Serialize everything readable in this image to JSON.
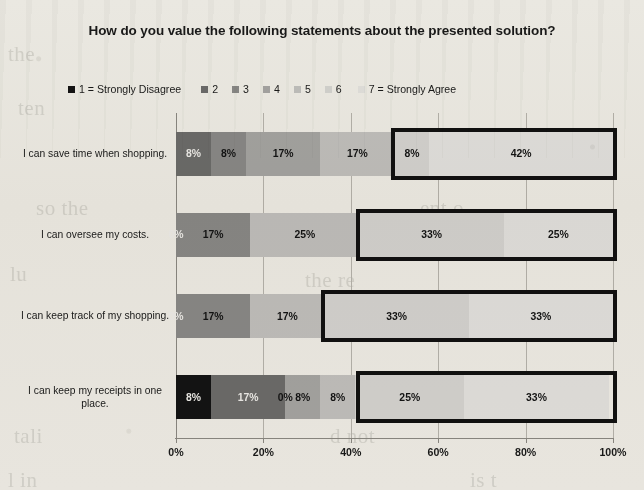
{
  "chart_data": {
    "type": "bar",
    "subtype": "stacked-100-horizontal",
    "title": "How do you value the following statements about the presented solution?",
    "xlabel": "",
    "ylabel": "",
    "xlim": [
      0,
      100
    ],
    "xticks": [
      "0%",
      "20%",
      "40%",
      "60%",
      "80%",
      "100%"
    ],
    "xtick_values": [
      0,
      20,
      40,
      60,
      80,
      100
    ],
    "grid": true,
    "legend_position": "top",
    "categories": [
      "I can save time when shopping.",
      "I can oversee my costs.",
      "I can keep track of my shopping.",
      "I can keep my receipts in one place."
    ],
    "series": [
      {
        "name": "1 = Strongly Disagree",
        "color": "#141414",
        "values": [
          0,
          0,
          0,
          8
        ]
      },
      {
        "name": "2",
        "color": "#6e6e6e",
        "values": [
          8,
          0,
          0,
          17
        ]
      },
      {
        "name": "3",
        "color": "#8c8c8c",
        "values": [
          8,
          17,
          17,
          0
        ]
      },
      {
        "name": "4",
        "color": "#a8a8a8",
        "values": [
          17,
          0,
          0,
          8
        ]
      },
      {
        "name": "5",
        "color": "#c4c4c4",
        "values": [
          17,
          25,
          17,
          8
        ]
      },
      {
        "name": "6",
        "color": "#d8d8d8",
        "values": [
          8,
          33,
          33,
          25
        ]
      },
      {
        "name": "7 = Strongly Agree",
        "color": "#e6e6e6",
        "values": [
          42,
          25,
          33,
          33
        ]
      }
    ],
    "bar_labels": [
      [
        "8%",
        "8%",
        "17%",
        "17%",
        "8%",
        "42%"
      ],
      [
        "0%",
        "17%",
        "25%",
        "33%",
        "25%"
      ],
      [
        "0%",
        "17%",
        "17%",
        "33%",
        "33%"
      ],
      [
        "8%",
        "17%",
        "0%",
        "8%",
        "8%",
        "25%",
        "33%"
      ]
    ],
    "annotations": [
      {
        "name": "agree-highlight",
        "description": "Thick black rectangle outlining combined 6 and 7 segments",
        "color": "#111111"
      }
    ],
    "rows": [
      {
        "label": "I can save time when shopping.",
        "segments": [
          {
            "series": "1 = Strongly Disagree",
            "value": 0,
            "label": "",
            "color": "#141414"
          },
          {
            "series": "2",
            "value": 8,
            "label": "8%",
            "color": "#6e6e6e"
          },
          {
            "series": "3",
            "value": 8,
            "label": "8%",
            "color": "#8c8c8c"
          },
          {
            "series": "4",
            "value": 17,
            "label": "17%",
            "color": "#a8a8a8"
          },
          {
            "series": "5",
            "value": 17,
            "label": "17%",
            "color": "#c4c4c4"
          },
          {
            "series": "6",
            "value": 8,
            "label": "8%",
            "color": "#d8d8d8"
          },
          {
            "series": "7 = Strongly Agree",
            "value": 42,
            "label": "42%",
            "color": "#e6e6e6"
          }
        ],
        "highlight_start": 50,
        "highlight_end": 100
      },
      {
        "label": "I can oversee my costs.",
        "segments": [
          {
            "series": "1 = Strongly Disagree",
            "value": 0,
            "label": "0%",
            "color": "#141414"
          },
          {
            "series": "2",
            "value": 0,
            "label": "",
            "color": "#6e6e6e"
          },
          {
            "series": "3",
            "value": 17,
            "label": "17%",
            "color": "#8c8c8c"
          },
          {
            "series": "4",
            "value": 0,
            "label": "",
            "color": "#a8a8a8"
          },
          {
            "series": "5",
            "value": 25,
            "label": "25%",
            "color": "#c4c4c4"
          },
          {
            "series": "6",
            "value": 33,
            "label": "33%",
            "color": "#d8d8d8"
          },
          {
            "series": "7 = Strongly Agree",
            "value": 25,
            "label": "25%",
            "color": "#e6e6e6"
          }
        ],
        "highlight_start": 42,
        "highlight_end": 100
      },
      {
        "label": "I can keep track of my shopping.",
        "segments": [
          {
            "series": "1 = Strongly Disagree",
            "value": 0,
            "label": "0%",
            "color": "#141414"
          },
          {
            "series": "2",
            "value": 0,
            "label": "",
            "color": "#6e6e6e"
          },
          {
            "series": "3",
            "value": 17,
            "label": "17%",
            "color": "#8c8c8c"
          },
          {
            "series": "4",
            "value": 0,
            "label": "",
            "color": "#a8a8a8"
          },
          {
            "series": "5",
            "value": 17,
            "label": "17%",
            "color": "#c4c4c4"
          },
          {
            "series": "6",
            "value": 33,
            "label": "33%",
            "color": "#d8d8d8"
          },
          {
            "series": "7 = Strongly Agree",
            "value": 33,
            "label": "33%",
            "color": "#e6e6e6"
          }
        ],
        "highlight_start": 34,
        "highlight_end": 100
      },
      {
        "label": "I can keep my receipts in one place.",
        "segments": [
          {
            "series": "1 = Strongly Disagree",
            "value": 8,
            "label": "8%",
            "color": "#141414"
          },
          {
            "series": "2",
            "value": 17,
            "label": "17%",
            "color": "#6e6e6e"
          },
          {
            "series": "3",
            "value": 0,
            "label": "0%",
            "color": "#8c8c8c"
          },
          {
            "series": "4",
            "value": 8,
            "label": "8%",
            "color": "#a8a8a8"
          },
          {
            "series": "5",
            "value": 8,
            "label": "8%",
            "color": "#c4c4c4"
          },
          {
            "series": "6",
            "value": 25,
            "label": "25%",
            "color": "#d8d8d8"
          },
          {
            "series": "7 = Strongly Agree",
            "value": 33,
            "label": "33%",
            "color": "#e6e6e6"
          }
        ],
        "highlight_start": 42,
        "highlight_end": 100
      }
    ]
  },
  "legend": {
    "items": [
      {
        "label": "1 = Strongly Disagree",
        "color": "#141414"
      },
      {
        "label": "2",
        "color": "#6e6e6e"
      },
      {
        "label": "3",
        "color": "#8c8c8c"
      },
      {
        "label": "4",
        "color": "#a8a8a8"
      },
      {
        "label": "5",
        "color": "#c4c4c4"
      },
      {
        "label": "6",
        "color": "#d8d8d8"
      },
      {
        "label": "7 = Strongly Agree",
        "color": "#e6e6e6"
      }
    ]
  }
}
